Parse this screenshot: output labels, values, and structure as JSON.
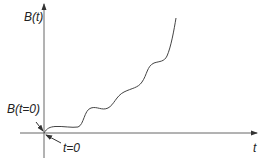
{
  "diagram": {
    "y_axis_label": "B(t)",
    "x_axis_label": "t",
    "origin_value_label": "B(t=0)",
    "origin_time_label": "t=0",
    "colors": {
      "axis": "#555555",
      "curve": "#444444",
      "text": "#222222"
    }
  }
}
